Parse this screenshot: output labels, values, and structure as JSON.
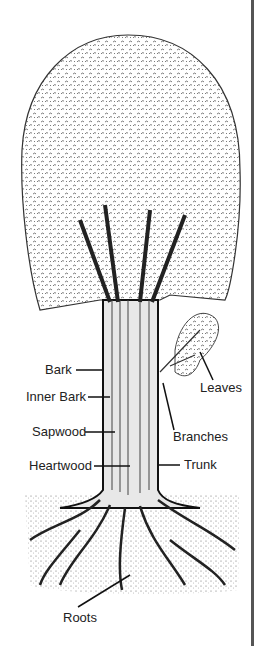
{
  "diagram": {
    "labels": {
      "bark": "Bark",
      "inner_bark": "Inner Bark",
      "sapwood": "Sapwood",
      "heartwood": "Heartwood",
      "leaves": "Leaves",
      "branches": "Branches",
      "trunk": "Trunk",
      "roots": "Roots"
    },
    "colors": {
      "ink": "#222222",
      "background": "#ffffff",
      "edge": "#555555"
    }
  }
}
